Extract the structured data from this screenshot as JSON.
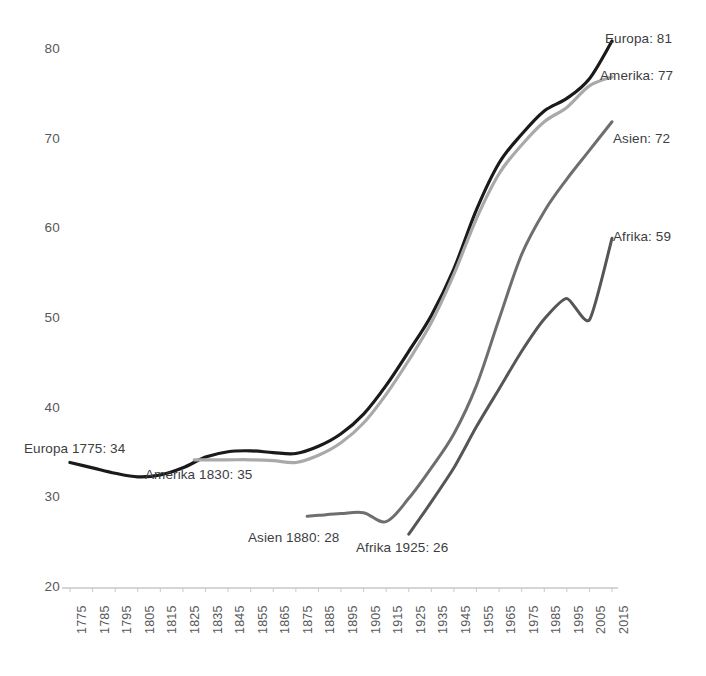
{
  "chart_data": {
    "type": "line",
    "title": "",
    "subtitle": "",
    "xlabel": "",
    "ylabel": "",
    "xlim": [
      1775,
      2015
    ],
    "ylim": [
      20,
      80
    ],
    "grid": false,
    "legend_position": "inline-right",
    "y_ticks": [
      "80",
      "70",
      "60",
      "50",
      "40",
      "30",
      "20"
    ],
    "y_tick_values": [
      80,
      70,
      60,
      50,
      40,
      30,
      20
    ],
    "x_ticks": [
      "1775",
      "1785",
      "1795",
      "1805",
      "1815",
      "1825",
      "1835",
      "1845",
      "1855",
      "1865",
      "1875",
      "1885",
      "1895",
      "1905",
      "1915",
      "1925",
      "1935",
      "1945",
      "1955",
      "1965",
      "1975",
      "1985",
      "1995",
      "2005",
      "2015"
    ],
    "x_tick_values": [
      1775,
      1785,
      1795,
      1805,
      1815,
      1825,
      1835,
      1845,
      1855,
      1865,
      1875,
      1885,
      1895,
      1905,
      1915,
      1925,
      1935,
      1945,
      1955,
      1965,
      1975,
      1985,
      1995,
      2005,
      2015
    ],
    "series": [
      {
        "name": "Europa",
        "color": "#1a1a1a",
        "width": 3.2,
        "end_label": "Europa: 81",
        "start_label": "Europa 1775: 34",
        "start_year": 1775,
        "start_value": 34,
        "end_year": 2015,
        "end_value": 81,
        "x": [
          1775,
          1785,
          1795,
          1805,
          1815,
          1825,
          1835,
          1845,
          1855,
          1865,
          1875,
          1885,
          1895,
          1905,
          1915,
          1925,
          1935,
          1945,
          1955,
          1965,
          1975,
          1985,
          1995,
          2005,
          2015
        ],
        "values": [
          34,
          33.4,
          32.8,
          32.4,
          32.6,
          33.4,
          34.6,
          35.2,
          35.3,
          35.1,
          35.0,
          35.8,
          37.2,
          39.4,
          42.6,
          46.4,
          50.4,
          55.6,
          62.2,
          67.4,
          70.6,
          73.2,
          74.6,
          76.8,
          81
        ]
      },
      {
        "name": "Amerika",
        "color": "#a9a9a9",
        "width": 3.2,
        "end_label": "Amerika: 77",
        "start_label": "Amerika 1830: 35",
        "start_year": 1830,
        "start_value": 35,
        "end_year": 2015,
        "end_value": 77,
        "x": [
          1830,
          1835,
          1845,
          1855,
          1865,
          1875,
          1885,
          1895,
          1905,
          1915,
          1925,
          1935,
          1945,
          1955,
          1965,
          1975,
          1985,
          1995,
          2005,
          2015
        ],
        "values": [
          34.3,
          34.3,
          34.3,
          34.3,
          34.2,
          34.0,
          34.8,
          36.2,
          38.4,
          41.6,
          45.4,
          49.6,
          55.0,
          61.2,
          66.2,
          69.4,
          72.0,
          73.6,
          76.0,
          77
        ]
      },
      {
        "name": "Asien",
        "color": "#6e6e6e",
        "width": 3.0,
        "end_label": "Asien: 72",
        "start_label": "Asien 1880: 28",
        "start_year": 1880,
        "start_value": 28,
        "end_year": 2015,
        "end_value": 72,
        "x": [
          1880,
          1885,
          1895,
          1905,
          1915,
          1925,
          1935,
          1945,
          1955,
          1965,
          1975,
          1985,
          1995,
          2005,
          2015
        ],
        "values": [
          28,
          28.1,
          28.3,
          28.4,
          27.4,
          30.0,
          33.4,
          37.2,
          42.6,
          50.0,
          57.2,
          62.0,
          65.6,
          68.8,
          72
        ]
      },
      {
        "name": "Afrika",
        "color": "#565656",
        "width": 3.0,
        "end_label": "Afrika: 59",
        "start_label": "Afrika 1925: 26",
        "start_year": 1925,
        "start_value": 26,
        "end_year": 2015,
        "end_value": 59,
        "x": [
          1925,
          1935,
          1945,
          1955,
          1965,
          1975,
          1985,
          1995,
          2005,
          2015
        ],
        "values": [
          26,
          29.6,
          33.4,
          38.0,
          42.2,
          46.4,
          50.0,
          52.3,
          49.9,
          59
        ]
      }
    ],
    "annotations": [
      {
        "text": "Europa 1775: 34",
        "x": 1775,
        "y": 34,
        "placement": "left-above"
      },
      {
        "text": "Amerika 1830: 35",
        "x": 1830,
        "y": 35,
        "placement": "below"
      },
      {
        "text": "Asien 1880: 28",
        "x": 1880,
        "y": 28,
        "placement": "below-left"
      },
      {
        "text": "Afrika 1925: 26",
        "x": 1925,
        "y": 26,
        "placement": "below"
      }
    ]
  }
}
